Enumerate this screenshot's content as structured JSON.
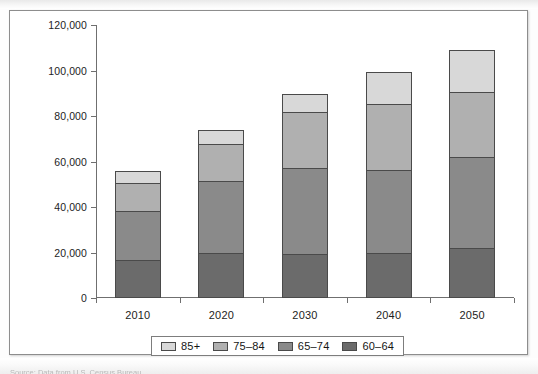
{
  "chart_data": {
    "type": "bar",
    "subtype": "stacked-vertical",
    "title": "",
    "xlabel": "",
    "ylabel": "",
    "categories": [
      "2010",
      "2020",
      "2030",
      "2040",
      "2050"
    ],
    "ylim": [
      0,
      120000
    ],
    "yticks": [
      0,
      20000,
      40000,
      60000,
      80000,
      100000,
      120000
    ],
    "ytick_labels": [
      "0",
      "20,000",
      "40,000",
      "60,000",
      "80,000",
      "100,000",
      "120,000"
    ],
    "grid": false,
    "legend_position": "bottom",
    "stack_order_bottom_to_top": [
      "60-64",
      "65-74",
      "75-84",
      "85+"
    ],
    "series": [
      {
        "name": "60-64",
        "color": "#6b6b6b",
        "values": [
          16500,
          20000,
          19500,
          20000,
          22000
        ]
      },
      {
        "name": "65-74",
        "color": "#8a8a8a",
        "values": [
          22000,
          32000,
          38000,
          36500,
          40500
        ]
      },
      {
        "name": "75-84",
        "color": "#b0b0b0",
        "values": [
          13000,
          16500,
          25000,
          29500,
          29000
        ]
      },
      {
        "name": "85+",
        "color": "#d8d8d8",
        "values": [
          5500,
          6500,
          8500,
          14500,
          19000
        ]
      }
    ],
    "totals": [
      57000,
      75000,
      91000,
      100500,
      110500
    ]
  },
  "legend": {
    "items": [
      {
        "label": "85+",
        "color": "#d8d8d8"
      },
      {
        "label": "75-84",
        "color": "#b0b0b0"
      },
      {
        "label": "65-74",
        "color": "#8a8a8a"
      },
      {
        "label": "60-64",
        "color": "#6b6b6b"
      }
    ]
  },
  "caption": {
    "source_text": "Source: Data from U.S. Census Bureau"
  }
}
